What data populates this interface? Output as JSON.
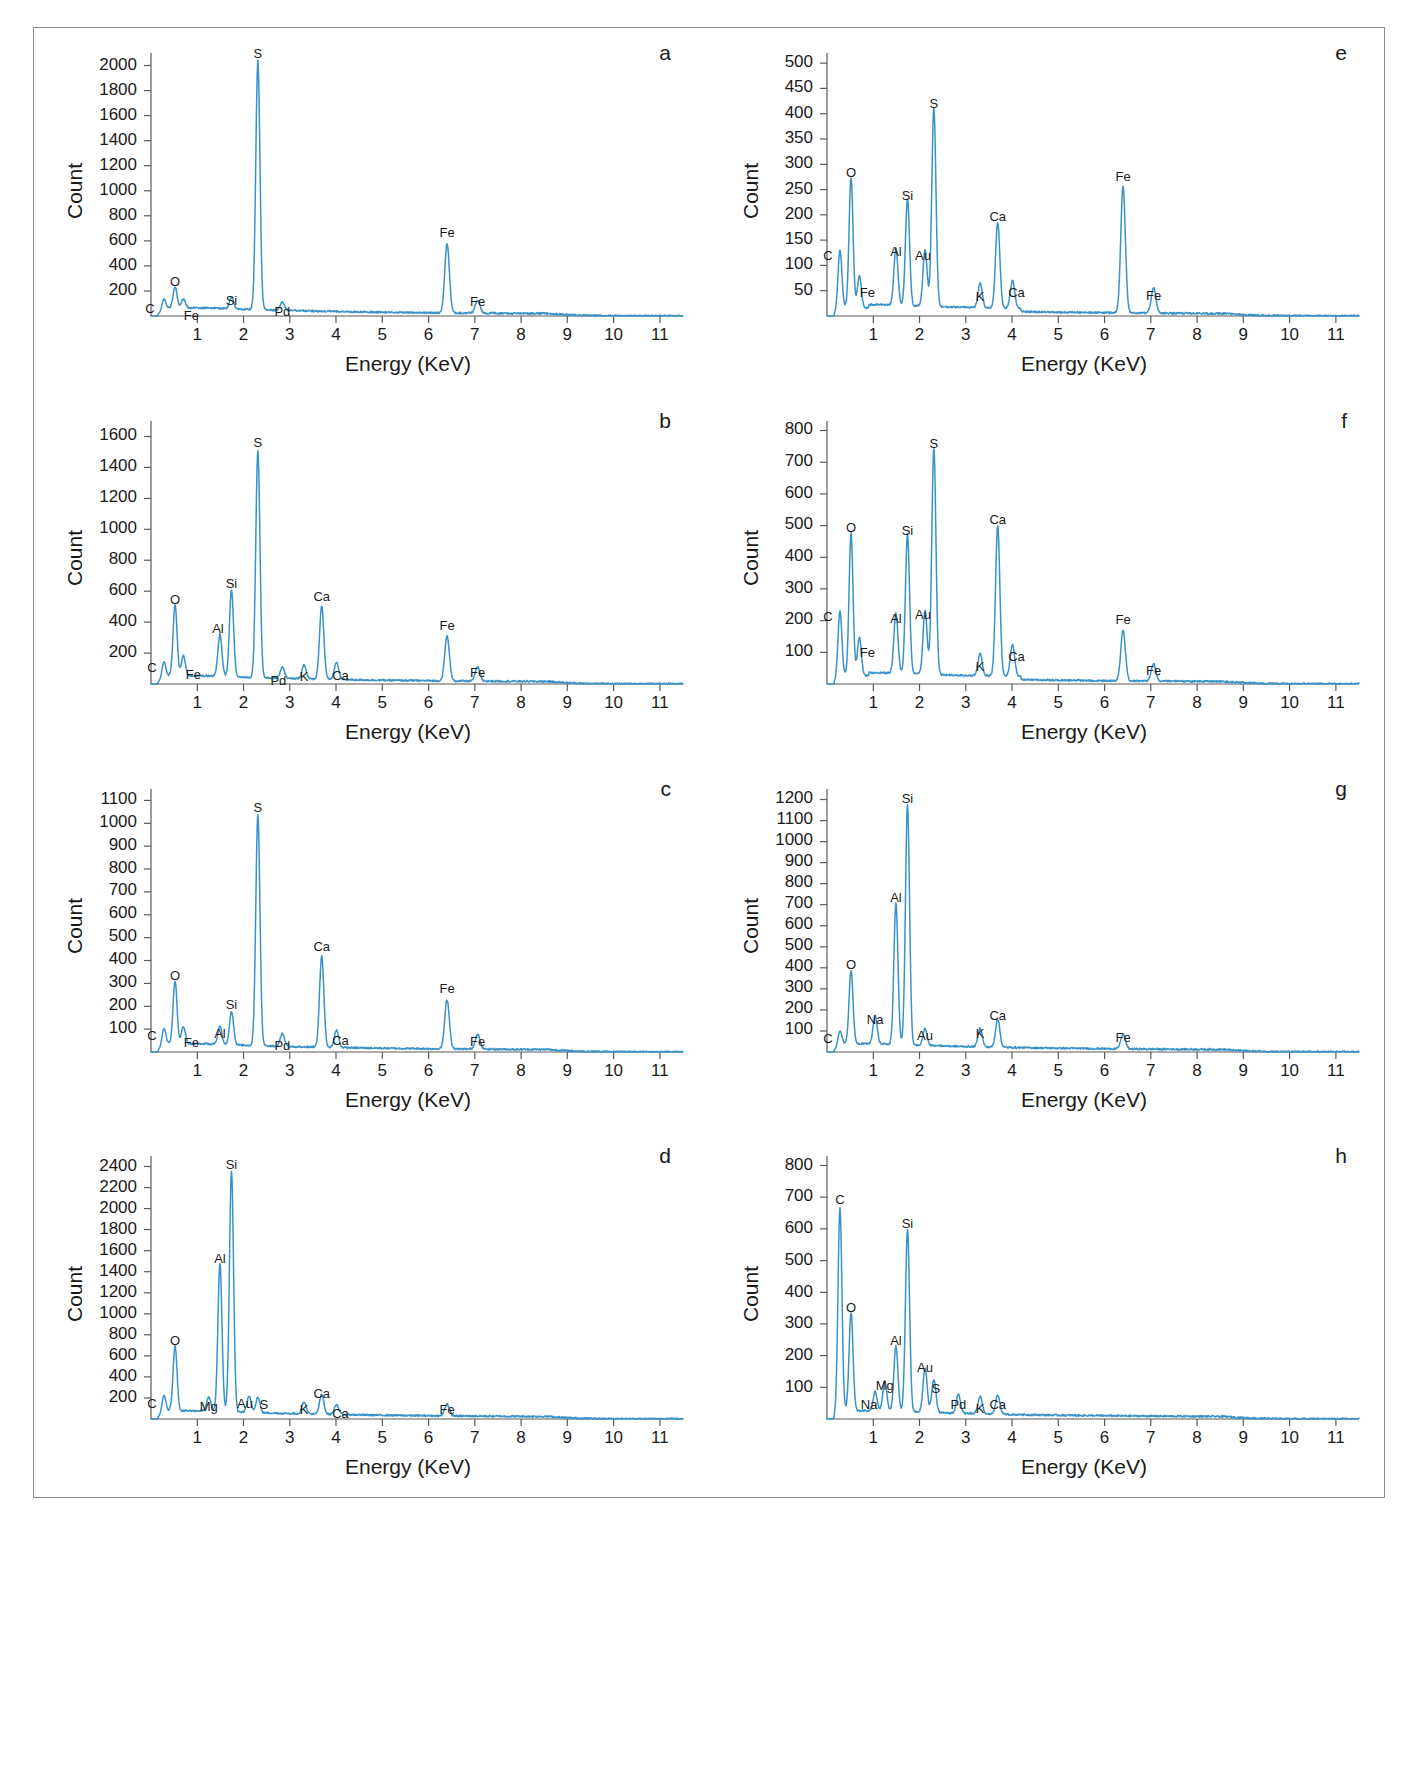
{
  "figure": {
    "type": "eds-spectra-multipanel",
    "panel_count": 8,
    "line_color": "#3a93c8",
    "axis_color": "#5a5a5a",
    "text_color": "#1a1a1a",
    "common_xlabel": "Energy (KeV)",
    "common_ylabel": "Count"
  },
  "chart_data": [
    {
      "id": "a",
      "type": "line",
      "title": "a",
      "xlabel": "Energy (KeV)",
      "ylabel": "Count",
      "xlim": [
        0,
        11.5
      ],
      "ylim": [
        0,
        2100
      ],
      "yticks": [
        200,
        400,
        600,
        800,
        1000,
        1200,
        1400,
        1600,
        1800,
        2000
      ],
      "xticks": [
        1,
        2,
        3,
        4,
        5,
        6,
        7,
        8,
        9,
        10,
        11
      ],
      "grid": false,
      "peaks": [
        {
          "label": "C",
          "energy": 0.28,
          "count": 95,
          "label_dx": -14,
          "label_dy": 14
        },
        {
          "label": "O",
          "energy": 0.52,
          "count": 165,
          "label_dx": 0,
          "label_dy": -4
        },
        {
          "label": "Fe",
          "energy": 0.7,
          "count": 70,
          "label_dx": 8,
          "label_dy": 18
        },
        {
          "label": "Si",
          "energy": 1.74,
          "count": 95,
          "label_dx": 0,
          "label_dy": 6
        },
        {
          "label": "S",
          "energy": 2.31,
          "count": 1985,
          "label_dx": 0,
          "label_dy": -4
        },
        {
          "label": "Pd",
          "energy": 2.84,
          "count": 70,
          "label_dx": 0,
          "label_dy": 14
        },
        {
          "label": "Fe",
          "energy": 6.4,
          "count": 555,
          "label_dx": 0,
          "label_dy": -4
        },
        {
          "label": "Fe",
          "energy": 7.06,
          "count": 105,
          "label_dx": 0,
          "label_dy": 8
        }
      ]
    },
    {
      "id": "b",
      "type": "line",
      "title": "b",
      "xlabel": "Energy (KeV)",
      "ylabel": "Count",
      "xlim": [
        0,
        11.5
      ],
      "ylim": [
        0,
        1700
      ],
      "yticks": [
        200,
        400,
        600,
        800,
        1000,
        1200,
        1400,
        1600
      ],
      "xticks": [
        1,
        2,
        3,
        4,
        5,
        6,
        7,
        8,
        9,
        10,
        11
      ],
      "grid": false,
      "peaks": [
        {
          "label": "C",
          "energy": 0.28,
          "count": 110,
          "label_dx": -12,
          "label_dy": 10
        },
        {
          "label": "O",
          "energy": 0.52,
          "count": 460,
          "label_dx": 0,
          "label_dy": -4
        },
        {
          "label": "Fe",
          "energy": 0.7,
          "count": 130,
          "label_dx": 10,
          "label_dy": 20
        },
        {
          "label": "Al",
          "energy": 1.49,
          "count": 270,
          "label_dx": -2,
          "label_dy": -4
        },
        {
          "label": "Si",
          "energy": 1.74,
          "count": 560,
          "label_dx": 0,
          "label_dy": -4
        },
        {
          "label": "S",
          "energy": 2.31,
          "count": 1470,
          "label_dx": 0,
          "label_dy": -4
        },
        {
          "label": "Pd",
          "energy": 2.84,
          "count": 75,
          "label_dx": -4,
          "label_dy": 18
        },
        {
          "label": "K",
          "energy": 3.31,
          "count": 90,
          "label_dx": 0,
          "label_dy": 16
        },
        {
          "label": "Ca",
          "energy": 3.69,
          "count": 475,
          "label_dx": 0,
          "label_dy": -4
        },
        {
          "label": "Ca",
          "energy": 4.01,
          "count": 110,
          "label_dx": 4,
          "label_dy": 18
        },
        {
          "label": "Fe",
          "energy": 6.4,
          "count": 290,
          "label_dx": 0,
          "label_dy": -4
        },
        {
          "label": "Fe",
          "energy": 7.06,
          "count": 90,
          "label_dx": 0,
          "label_dy": 12
        }
      ]
    },
    {
      "id": "c",
      "type": "line",
      "title": "c",
      "xlabel": "Energy (KeV)",
      "ylabel": "Count",
      "xlim": [
        0,
        11.5
      ],
      "ylim": [
        0,
        1150
      ],
      "yticks": [
        100,
        200,
        300,
        400,
        500,
        600,
        700,
        800,
        900,
        1000,
        1100
      ],
      "xticks": [
        1,
        2,
        3,
        4,
        5,
        6,
        7,
        8,
        9,
        10,
        11
      ],
      "grid": false,
      "peaks": [
        {
          "label": "C",
          "energy": 0.28,
          "count": 80,
          "label_dx": -12,
          "label_dy": 12
        },
        {
          "label": "O",
          "energy": 0.52,
          "count": 275,
          "label_dx": 0,
          "label_dy": -4
        },
        {
          "label": "Fe",
          "energy": 0.7,
          "count": 75,
          "label_dx": 8,
          "label_dy": 18
        },
        {
          "label": "Al",
          "energy": 1.49,
          "count": 80,
          "label_dx": 0,
          "label_dy": 10
        },
        {
          "label": "Si",
          "energy": 1.74,
          "count": 145,
          "label_dx": 0,
          "label_dy": -4
        },
        {
          "label": "S",
          "energy": 2.31,
          "count": 1010,
          "label_dx": 0,
          "label_dy": -4
        },
        {
          "label": "Pd",
          "energy": 2.84,
          "count": 55,
          "label_dx": 0,
          "label_dy": 16
        },
        {
          "label": "Ca",
          "energy": 3.69,
          "count": 400,
          "label_dx": 0,
          "label_dy": -4
        },
        {
          "label": "Ca",
          "energy": 4.01,
          "count": 75,
          "label_dx": 4,
          "label_dy": 16
        },
        {
          "label": "Fe",
          "energy": 6.4,
          "count": 215,
          "label_dx": 0,
          "label_dy": -4
        },
        {
          "label": "Fe",
          "energy": 7.06,
          "count": 65,
          "label_dx": 0,
          "label_dy": 14
        }
      ]
    },
    {
      "id": "d",
      "type": "line",
      "title": "d",
      "xlabel": "Energy (KeV)",
      "ylabel": "Count",
      "xlim": [
        0,
        11.5
      ],
      "ylim": [
        0,
        2500
      ],
      "yticks": [
        200,
        400,
        600,
        800,
        1000,
        1200,
        1400,
        1600,
        1800,
        2000,
        2200,
        2400
      ],
      "xticks": [
        1,
        2,
        3,
        4,
        5,
        6,
        7,
        8,
        9,
        10,
        11
      ],
      "grid": false,
      "peaks": [
        {
          "label": "C",
          "energy": 0.28,
          "count": 175,
          "label_dx": -12,
          "label_dy": 12
        },
        {
          "label": "O",
          "energy": 0.52,
          "count": 620,
          "label_dx": 0,
          "label_dy": -4
        },
        {
          "label": "Mg",
          "energy": 1.25,
          "count": 130,
          "label_dx": 0,
          "label_dy": 10
        },
        {
          "label": "Al",
          "energy": 1.49,
          "count": 1400,
          "label_dx": 0,
          "label_dy": -4
        },
        {
          "label": "Si",
          "energy": 1.74,
          "count": 2290,
          "label_dx": 0,
          "label_dy": -4
        },
        {
          "label": "Au",
          "energy": 2.12,
          "count": 150,
          "label_dx": -4,
          "label_dy": 10
        },
        {
          "label": "S",
          "energy": 2.31,
          "count": 145,
          "label_dx": 6,
          "label_dy": 10
        },
        {
          "label": "K",
          "energy": 3.31,
          "count": 115,
          "label_dx": 0,
          "label_dy": 12
        },
        {
          "label": "Ca",
          "energy": 3.69,
          "count": 190,
          "label_dx": 0,
          "label_dy": 4
        },
        {
          "label": "Ca",
          "energy": 4.01,
          "count": 95,
          "label_dx": 4,
          "label_dy": 14
        },
        {
          "label": "Fe",
          "energy": 6.4,
          "count": 115,
          "label_dx": 0,
          "label_dy": 12
        }
      ]
    },
    {
      "id": "e",
      "type": "line",
      "title": "e",
      "xlabel": "Energy (KeV)",
      "ylabel": "Count",
      "xlim": [
        0,
        11.5
      ],
      "ylim": [
        0,
        520
      ],
      "yticks": [
        50,
        100,
        150,
        200,
        250,
        300,
        350,
        400,
        450,
        500
      ],
      "xticks": [
        1,
        2,
        3,
        4,
        5,
        6,
        7,
        8,
        9,
        10,
        11
      ],
      "grid": false,
      "peaks": [
        {
          "label": "C",
          "energy": 0.28,
          "count": 120,
          "label_dx": -12,
          "label_dy": 10
        },
        {
          "label": "O",
          "energy": 0.52,
          "count": 258,
          "label_dx": 0,
          "label_dy": -4
        },
        {
          "label": "Fe",
          "energy": 0.7,
          "count": 63,
          "label_dx": 8,
          "label_dy": 18
        },
        {
          "label": "Al",
          "energy": 1.49,
          "count": 112,
          "label_dx": 0,
          "label_dy": 2
        },
        {
          "label": "Si",
          "energy": 1.74,
          "count": 212,
          "label_dx": 0,
          "label_dy": -4
        },
        {
          "label": "Au",
          "energy": 2.12,
          "count": 112,
          "label_dx": -2,
          "label_dy": 6
        },
        {
          "label": "S",
          "energy": 2.31,
          "count": 393,
          "label_dx": 0,
          "label_dy": -4
        },
        {
          "label": "K",
          "energy": 3.31,
          "count": 48,
          "label_dx": 0,
          "label_dy": 14
        },
        {
          "label": "Ca",
          "energy": 3.69,
          "count": 170,
          "label_dx": 0,
          "label_dy": -4
        },
        {
          "label": "Ca",
          "energy": 4.01,
          "count": 55,
          "label_dx": 4,
          "label_dy": 14
        },
        {
          "label": "Fe",
          "energy": 6.4,
          "count": 250,
          "label_dx": 0,
          "label_dy": -4
        },
        {
          "label": "Fe",
          "energy": 7.06,
          "count": 50,
          "label_dx": 0,
          "label_dy": 14
        }
      ]
    },
    {
      "id": "f",
      "type": "line",
      "title": "f",
      "xlabel": "Energy (KeV)",
      "ylabel": "Count",
      "xlim": [
        0,
        11.5
      ],
      "ylim": [
        0,
        830
      ],
      "yticks": [
        100,
        200,
        300,
        400,
        500,
        600,
        700,
        800
      ],
      "xticks": [
        1,
        2,
        3,
        4,
        5,
        6,
        7,
        8,
        9,
        10,
        11
      ],
      "grid": false,
      "peaks": [
        {
          "label": "C",
          "energy": 0.28,
          "count": 215,
          "label_dx": -12,
          "label_dy": 10
        },
        {
          "label": "O",
          "energy": 0.52,
          "count": 450,
          "label_dx": 0,
          "label_dy": -4
        },
        {
          "label": "Fe",
          "energy": 0.7,
          "count": 120,
          "label_dx": 8,
          "label_dy": 16
        },
        {
          "label": "Al",
          "energy": 1.49,
          "count": 190,
          "label_dx": 0,
          "label_dy": 4
        },
        {
          "label": "Si",
          "energy": 1.74,
          "count": 440,
          "label_dx": 0,
          "label_dy": -4
        },
        {
          "label": "Au",
          "energy": 2.12,
          "count": 200,
          "label_dx": -2,
          "label_dy": 4
        },
        {
          "label": "S",
          "energy": 2.31,
          "count": 715,
          "label_dx": 0,
          "label_dy": -4
        },
        {
          "label": "K",
          "energy": 3.31,
          "count": 70,
          "label_dx": 0,
          "label_dy": 14
        },
        {
          "label": "Ca",
          "energy": 3.69,
          "count": 475,
          "label_dx": 0,
          "label_dy": -4
        },
        {
          "label": "Ca",
          "energy": 4.01,
          "count": 100,
          "label_dx": 4,
          "label_dy": 14
        },
        {
          "label": "Fe",
          "energy": 6.4,
          "count": 160,
          "label_dx": 0,
          "label_dy": -4
        },
        {
          "label": "Fe",
          "energy": 7.06,
          "count": 55,
          "label_dx": 0,
          "label_dy": 14
        }
      ]
    },
    {
      "id": "g",
      "type": "line",
      "title": "g",
      "xlabel": "Energy (KeV)",
      "ylabel": "Count",
      "xlim": [
        0,
        11.5
      ],
      "ylim": [
        0,
        1250
      ],
      "yticks": [
        100,
        200,
        300,
        400,
        500,
        600,
        700,
        800,
        900,
        1000,
        1100,
        1200
      ],
      "xticks": [
        1,
        2,
        3,
        4,
        5,
        6,
        7,
        8,
        9,
        10,
        11
      ],
      "grid": false,
      "peaks": [
        {
          "label": "C",
          "energy": 0.28,
          "count": 75,
          "label_dx": -12,
          "label_dy": 12
        },
        {
          "label": "O",
          "energy": 0.52,
          "count": 350,
          "label_dx": 0,
          "label_dy": -4
        },
        {
          "label": "Na",
          "energy": 1.04,
          "count": 135,
          "label_dx": 0,
          "label_dy": 6
        },
        {
          "label": "Al",
          "energy": 1.49,
          "count": 670,
          "label_dx": 0,
          "label_dy": -4
        },
        {
          "label": "Si",
          "energy": 1.74,
          "count": 1140,
          "label_dx": 0,
          "label_dy": -4
        },
        {
          "label": "Au",
          "energy": 2.12,
          "count": 80,
          "label_dx": 0,
          "label_dy": 10
        },
        {
          "label": "K",
          "energy": 3.31,
          "count": 90,
          "label_dx": 0,
          "label_dy": 10
        },
        {
          "label": "Ca",
          "energy": 3.69,
          "count": 135,
          "label_dx": 0,
          "label_dy": 2
        },
        {
          "label": "Fe",
          "energy": 6.4,
          "count": 70,
          "label_dx": 0,
          "label_dy": 10
        }
      ]
    },
    {
      "id": "h",
      "type": "line",
      "title": "h",
      "xlabel": "Energy (KeV)",
      "ylabel": "Count",
      "xlim": [
        0,
        11.5
      ],
      "ylim": [
        0,
        830
      ],
      "yticks": [
        100,
        200,
        300,
        400,
        500,
        600,
        700,
        800
      ],
      "xticks": [
        1,
        2,
        3,
        4,
        5,
        6,
        7,
        8,
        9,
        10,
        11
      ],
      "grid": false,
      "peaks": [
        {
          "label": "C",
          "energy": 0.28,
          "count": 650,
          "label_dx": 0,
          "label_dy": -4
        },
        {
          "label": "O",
          "energy": 0.52,
          "count": 310,
          "label_dx": 0,
          "label_dy": -4
        },
        {
          "label": "Na",
          "energy": 1.04,
          "count": 60,
          "label_dx": -6,
          "label_dy": 14
        },
        {
          "label": "Mg",
          "energy": 1.25,
          "count": 95,
          "label_dx": 0,
          "label_dy": 6
        },
        {
          "label": "Al",
          "energy": 1.49,
          "count": 205,
          "label_dx": 0,
          "label_dy": -4
        },
        {
          "label": "Si",
          "energy": 1.74,
          "count": 575,
          "label_dx": 0,
          "label_dy": -4
        },
        {
          "label": "Au",
          "energy": 2.12,
          "count": 140,
          "label_dx": 0,
          "label_dy": 2
        },
        {
          "label": "S",
          "energy": 2.31,
          "count": 105,
          "label_dx": 2,
          "label_dy": 12
        },
        {
          "label": "Pd",
          "energy": 2.84,
          "count": 60,
          "label_dx": 0,
          "label_dy": 14
        },
        {
          "label": "K",
          "energy": 3.31,
          "count": 55,
          "label_dx": 0,
          "label_dy": 16
        },
        {
          "label": "Ca",
          "energy": 3.69,
          "count": 60,
          "label_dx": 0,
          "label_dy": 14
        }
      ]
    }
  ]
}
